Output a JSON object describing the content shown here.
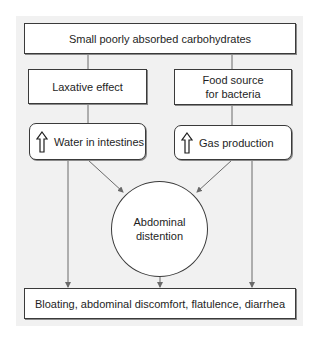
{
  "diagram": {
    "top": {
      "label": "Small poorly absorbed carbohydrates"
    },
    "left_cause": {
      "label": "Laxative effect"
    },
    "right_cause": {
      "label": "Food source for bacteria"
    },
    "left_effect": {
      "icon": "up-arrow-icon",
      "label": "Water in intestines"
    },
    "right_effect": {
      "icon": "up-arrow-icon",
      "label": "Gas production"
    },
    "center": {
      "label": "Abdominal distention"
    },
    "bottom": {
      "label": "Bloating, abdominal discomfort, flatulence, diarrhea"
    },
    "colors": {
      "panel": "#f1f1f1",
      "box_border": "#3a3a3a",
      "connector": "#6a6a6a"
    }
  }
}
